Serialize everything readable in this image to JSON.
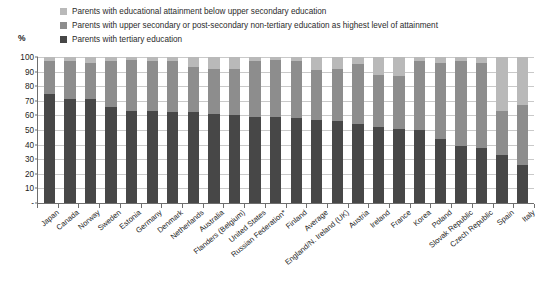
{
  "axis": {
    "unit": "%",
    "yticks": [
      0,
      10,
      20,
      30,
      40,
      50,
      60,
      70,
      80,
      90,
      100
    ],
    "ylim": [
      0,
      100
    ]
  },
  "legend": {
    "items": [
      {
        "label": "Parents with educational attainment below upper secondary education",
        "color": "#b9b9b9",
        "key": "below_upper_secondary"
      },
      {
        "label": "Parents with upper secondary or post-secondary non-tertiary education as highest level of attainment",
        "color": "#8d8d8d",
        "key": "upper_secondary"
      },
      {
        "label": "Parents with tertiary education",
        "color": "#474747",
        "key": "tertiary"
      }
    ]
  },
  "chart_data": {
    "type": "bar",
    "subtype": "stacked-column",
    "title": "",
    "xlabel": "",
    "ylabel": "%",
    "ylim": [
      0,
      100
    ],
    "yticks": [
      0,
      10,
      20,
      30,
      40,
      50,
      60,
      70,
      80,
      90,
      100
    ],
    "grid": true,
    "legend_position": "top",
    "categories": [
      "Japan",
      "Canada",
      "Norway",
      "Sweden",
      "Estonia",
      "Germany",
      "Denmark",
      "Netherlands",
      "Australia",
      "Flanders (Belgium)",
      "United States",
      "Russian Federation*",
      "Finland",
      "Average",
      "England/N. Ireland (UK)",
      "Austria",
      "Ireland",
      "France",
      "Korea",
      "Poland",
      "Slovak Republic",
      "Czech Republic",
      "Spain",
      "Italy"
    ],
    "series": [
      {
        "name": "Parents with tertiary education",
        "key": "tertiary",
        "color": "#474747",
        "values": [
          75,
          71,
          71,
          66,
          63,
          63,
          62,
          62,
          61,
          60,
          59,
          59,
          58,
          57,
          56,
          54,
          52,
          51,
          50,
          44,
          39,
          38,
          33,
          26
        ]
      },
      {
        "name": "Parents with upper secondary or post-secondary non-tertiary education as highest level of attainment",
        "key": "upper_secondary",
        "color": "#8d8d8d",
        "values": [
          22,
          26,
          25,
          31,
          35,
          34,
          35,
          31,
          31,
          32,
          38,
          39,
          39,
          34,
          36,
          41,
          36,
          36,
          47,
          52,
          58,
          58,
          30,
          41
        ]
      },
      {
        "name": "Parents with educational attainment below upper secondary education",
        "key": "below_upper_secondary",
        "color": "#b9b9b9",
        "values": [
          3,
          3,
          4,
          3,
          2,
          3,
          3,
          7,
          8,
          8,
          3,
          2,
          3,
          9,
          8,
          5,
          12,
          13,
          3,
          4,
          3,
          4,
          37,
          33
        ]
      }
    ]
  }
}
